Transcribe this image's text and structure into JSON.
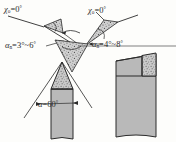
{
  "figure": {
    "kind": "engineering-drawing",
    "background_color": "#fdfdfb",
    "line_color": "#2b2b2b",
    "body_fill": "#b9b9b9",
    "insert_fill": "#cfcfcf",
    "hatch_color": "#555555"
  },
  "labels": {
    "chi_left": {
      "symbol": "χ",
      "subscript": "o",
      "equals": "=",
      "value": "0",
      "unit": "°"
    },
    "chi_right": {
      "symbol": "χ",
      "subscript": "o",
      "equals": "=",
      "value": "0",
      "unit": "°"
    },
    "alpha_left": {
      "symbol": "α",
      "subscript": "n",
      "equals": "=",
      "value": "3°~6",
      "unit": "°"
    },
    "alpha_right": {
      "symbol": "α",
      "subscript": "n",
      "equals": "=",
      "value": "4°~8",
      "unit": "°"
    },
    "alpha_bottom": {
      "symbol": "α",
      "subscript": "",
      "equals": "=",
      "value": "60",
      "unit": "°"
    }
  },
  "callouts": [
    {
      "name": "detail-wedge-upper-left",
      "angle_label_ref": "alpha_left"
    },
    {
      "name": "detail-wedge-upper-right",
      "angle_label_ref": "alpha_right"
    },
    {
      "name": "detail-wedge-lower-center",
      "angle_label_ref": "alpha_bottom"
    }
  ],
  "objects": [
    {
      "name": "pointed-tool-left",
      "parts": [
        "shank",
        "brazed-insert-tip"
      ]
    },
    {
      "name": "shank-tool-right",
      "parts": [
        "shank",
        "chamfered-face",
        "brazed-insert"
      ]
    }
  ]
}
